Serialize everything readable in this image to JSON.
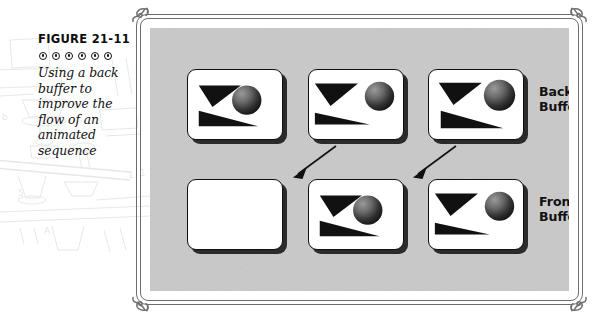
{
  "figure": {
    "number": "FIGURE 21-11",
    "dot_count": 6,
    "dot_icon": "concentric-dot-ornament",
    "caption": "Using a back buffer to improve the flow of an animated sequence"
  },
  "frame": {
    "corner_icon": "scroll-flourish-ornament",
    "border_color": "#6d6d6d",
    "stage_color": "#c9c9c9"
  },
  "diagram": {
    "type": "double-buffering-animation-sequence",
    "labels": [
      {
        "name": "back-buffer",
        "text": "Back\nBuffer"
      },
      {
        "name": "front-buffer",
        "text": "Front\nBuffer"
      }
    ],
    "rows": [
      {
        "name": "back-buffer-row",
        "label": "Back\nBuffer",
        "panels": [
          {
            "name": "back-buffer-frame-1",
            "state": "ball-left",
            "empty": false,
            "ball_cx": 60,
            "ball_cy": 31,
            "ball_r": 15,
            "wedge_length": 58
          },
          {
            "name": "back-buffer-frame-2",
            "state": "ball-mid",
            "empty": false,
            "ball_cx": 72,
            "ball_cy": 27,
            "ball_r": 15,
            "wedge_length": 50
          },
          {
            "name": "back-buffer-frame-3",
            "state": "ball-right",
            "empty": false,
            "ball_cx": 72,
            "ball_cy": 26,
            "ball_r": 16,
            "wedge_length": 60
          }
        ]
      },
      {
        "name": "front-buffer-row",
        "label": "Front\nBuffer",
        "panels": [
          {
            "name": "front-buffer-frame-1",
            "state": "blank",
            "empty": true,
            "ball_cx": 0,
            "ball_cy": 0,
            "ball_r": 0,
            "wedge_length": 0
          },
          {
            "name": "front-buffer-frame-2",
            "state": "ball-left",
            "empty": false,
            "ball_cx": 60,
            "ball_cy": 31,
            "ball_r": 15,
            "wedge_length": 58
          },
          {
            "name": "front-buffer-frame-3",
            "state": "ball-mid",
            "empty": false,
            "ball_cx": 72,
            "ball_cy": 27,
            "ball_r": 15,
            "wedge_length": 50
          }
        ]
      }
    ],
    "arrows": [
      {
        "name": "copy-arrow-1",
        "from": "back-buffer-frame-2",
        "to": "front-buffer-frame-2"
      },
      {
        "name": "copy-arrow-2",
        "from": "back-buffer-frame-3",
        "to": "front-buffer-frame-3"
      }
    ],
    "shapes": {
      "triangle_color": "#111111",
      "sphere_gradient_light": "#8f8f8f",
      "sphere_gradient_dark": "#1a1a1a"
    }
  }
}
